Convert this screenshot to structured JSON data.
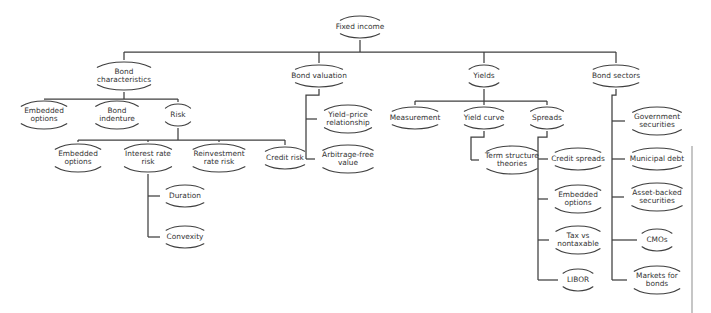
{
  "diagram": {
    "type": "tree",
    "title": "Fixed income",
    "orientation": "top-down",
    "node_shape": "split-ellipse-arcs",
    "colors": {
      "background": "#ffffff",
      "stroke": "#3f3f3f",
      "text": "#333333",
      "page_edge": "#8d8d8d"
    },
    "nodes": [
      {
        "id": "fixed-income",
        "label": "Fixed income",
        "lines": [
          "Fixed income"
        ],
        "x": 360,
        "y": 27,
        "rx": 25,
        "ry": 11,
        "level": 0
      },
      {
        "id": "bond-characteristics",
        "label": "Bond characteristics",
        "lines": [
          "Bond",
          "characteristics"
        ],
        "x": 124,
        "y": 76,
        "rx": 34,
        "ry": 14,
        "level": 1
      },
      {
        "id": "bond-valuation",
        "label": "Bond valuation",
        "lines": [
          "Bond valuation"
        ],
        "x": 319,
        "y": 76,
        "rx": 30,
        "ry": 11,
        "level": 1
      },
      {
        "id": "yields",
        "label": "Yields",
        "lines": [
          "Yields"
        ],
        "x": 484,
        "y": 76,
        "rx": 19,
        "ry": 11,
        "level": 1
      },
      {
        "id": "bond-sectors",
        "label": "Bond sectors",
        "lines": [
          "Bond sectors"
        ],
        "x": 616,
        "y": 76,
        "rx": 29,
        "ry": 11,
        "level": 1
      },
      {
        "id": "embedded-options-bc",
        "label": "Embedded options",
        "lines": [
          "Embedded",
          "options"
        ],
        "x": 44,
        "y": 115,
        "rx": 29,
        "ry": 14,
        "level": 2
      },
      {
        "id": "bond-indenture",
        "label": "Bond indenture",
        "lines": [
          "Bond",
          "indenture"
        ],
        "x": 117,
        "y": 115,
        "rx": 27,
        "ry": 14,
        "level": 2
      },
      {
        "id": "risk",
        "label": "Risk",
        "lines": [
          "Risk"
        ],
        "x": 178,
        "y": 115,
        "rx": 16,
        "ry": 11,
        "level": 2
      },
      {
        "id": "embedded-options-risk",
        "label": "Embedded options",
        "lines": [
          "Embedded",
          "options"
        ],
        "x": 78,
        "y": 158,
        "rx": 29,
        "ry": 14,
        "level": 3
      },
      {
        "id": "interest-rate-risk",
        "label": "Interest rate risk",
        "lines": [
          "Interest rate",
          "risk"
        ],
        "x": 148,
        "y": 158,
        "rx": 30,
        "ry": 14,
        "level": 3
      },
      {
        "id": "reinvestment-rate-risk",
        "label": "Reinvestment rate risk",
        "lines": [
          "Reinvestment",
          "rate risk"
        ],
        "x": 219,
        "y": 158,
        "rx": 33,
        "ry": 14,
        "level": 3
      },
      {
        "id": "credit-risk",
        "label": "Credit risk",
        "lines": [
          "Credit risk"
        ],
        "x": 285,
        "y": 158,
        "rx": 25,
        "ry": 11,
        "level": 3
      },
      {
        "id": "duration",
        "label": "Duration",
        "lines": [
          "Duration"
        ],
        "x": 185,
        "y": 196,
        "rx": 24,
        "ry": 11,
        "level": 4
      },
      {
        "id": "convexity",
        "label": "Convexity",
        "lines": [
          "Convexity"
        ],
        "x": 185,
        "y": 237,
        "rx": 24,
        "ry": 11,
        "level": 4
      },
      {
        "id": "yield-price-relationship",
        "label": "Yield–price relationship",
        "lines": [
          "Yield–price",
          "relationship"
        ],
        "x": 348,
        "y": 119,
        "rx": 30,
        "ry": 14,
        "level": 2
      },
      {
        "id": "arbitrage-free-value",
        "label": "Arbitrage-free value",
        "lines": [
          "Arbitrage-free",
          "value"
        ],
        "x": 348,
        "y": 159,
        "rx": 32,
        "ry": 14,
        "level": 2
      },
      {
        "id": "measurement",
        "label": "Measurement",
        "lines": [
          "Measurement"
        ],
        "x": 415,
        "y": 118,
        "rx": 29,
        "ry": 11,
        "level": 2
      },
      {
        "id": "yield-curve",
        "label": "Yield curve",
        "lines": [
          "Yield curve"
        ],
        "x": 484,
        "y": 118,
        "rx": 25,
        "ry": 11,
        "level": 2
      },
      {
        "id": "spreads",
        "label": "Spreads",
        "lines": [
          "Spreads"
        ],
        "x": 547,
        "y": 118,
        "rx": 21,
        "ry": 11,
        "level": 2
      },
      {
        "id": "term-structure-theories",
        "label": "Term structure theories",
        "lines": [
          "Term structure",
          "theories"
        ],
        "x": 512,
        "y": 160,
        "rx": 32,
        "ry": 14,
        "level": 3
      },
      {
        "id": "credit-spreads",
        "label": "Credit spreads",
        "lines": [
          "Credit spreads"
        ],
        "x": 578,
        "y": 159,
        "rx": 29,
        "ry": 11,
        "level": 3
      },
      {
        "id": "embedded-options-spread",
        "label": "Embedded options",
        "lines": [
          "Embedded",
          "options"
        ],
        "x": 578,
        "y": 199,
        "rx": 29,
        "ry": 14,
        "level": 3
      },
      {
        "id": "tax-vs-nontaxable",
        "label": "Tax vs nontaxable",
        "lines": [
          "Tax vs",
          "nontaxable"
        ],
        "x": 578,
        "y": 240,
        "rx": 28,
        "ry": 14,
        "level": 3
      },
      {
        "id": "libor",
        "label": "LIBOR",
        "lines": [
          "LIBOR"
        ],
        "x": 578,
        "y": 280,
        "rx": 19,
        "ry": 11,
        "level": 3
      },
      {
        "id": "government-securities",
        "label": "Government securities",
        "lines": [
          "Government",
          "securities"
        ],
        "x": 657,
        "y": 121,
        "rx": 31,
        "ry": 14,
        "level": 2
      },
      {
        "id": "municipal-debt",
        "label": "Municipal debt",
        "lines": [
          "Municipal debt"
        ],
        "x": 657,
        "y": 159,
        "rx": 31,
        "ry": 11,
        "level": 2
      },
      {
        "id": "asset-backed-securities",
        "label": "Asset-backed securities",
        "lines": [
          "Asset-backed",
          "securities"
        ],
        "x": 657,
        "y": 197,
        "rx": 32,
        "ry": 14,
        "level": 2
      },
      {
        "id": "cmos",
        "label": "CMOs",
        "lines": [
          "CMOs"
        ],
        "x": 657,
        "y": 240,
        "rx": 19,
        "ry": 11,
        "level": 2
      },
      {
        "id": "markets-for-bonds",
        "label": "Markets for bonds",
        "lines": [
          "Markets for",
          "bonds"
        ],
        "x": 657,
        "y": 280,
        "rx": 29,
        "ry": 14,
        "level": 2
      }
    ],
    "edges": [
      {
        "from": "fixed-income",
        "to": "bond-characteristics",
        "style": "bus",
        "bus_y": 52
      },
      {
        "from": "fixed-income",
        "to": "bond-valuation",
        "style": "bus",
        "bus_y": 52
      },
      {
        "from": "fixed-income",
        "to": "yields",
        "style": "bus",
        "bus_y": 52
      },
      {
        "from": "fixed-income",
        "to": "bond-sectors",
        "style": "bus",
        "bus_y": 52
      },
      {
        "from": "bond-characteristics",
        "to": "embedded-options-bc",
        "style": "bus",
        "bus_y": 99
      },
      {
        "from": "bond-characteristics",
        "to": "bond-indenture",
        "style": "bus",
        "bus_y": 99
      },
      {
        "from": "bond-characteristics",
        "to": "risk",
        "style": "bus",
        "bus_y": 99
      },
      {
        "from": "risk",
        "to": "embedded-options-risk",
        "style": "bus",
        "bus_y": 140
      },
      {
        "from": "risk",
        "to": "interest-rate-risk",
        "style": "bus",
        "bus_y": 140
      },
      {
        "from": "risk",
        "to": "reinvestment-rate-risk",
        "style": "bus",
        "bus_y": 140
      },
      {
        "from": "risk",
        "to": "credit-risk",
        "style": "bus",
        "bus_y": 140
      },
      {
        "from": "interest-rate-risk",
        "to": "duration",
        "style": "elbow",
        "spine_x": 148
      },
      {
        "from": "interest-rate-risk",
        "to": "convexity",
        "style": "elbow",
        "spine_x": 148
      },
      {
        "from": "bond-valuation",
        "to": "yield-price-relationship",
        "style": "elbow",
        "spine_x": 306
      },
      {
        "from": "bond-valuation",
        "to": "arbitrage-free-value",
        "style": "elbow",
        "spine_x": 306
      },
      {
        "from": "yields",
        "to": "measurement",
        "style": "bus",
        "bus_y": 101
      },
      {
        "from": "yields",
        "to": "yield-curve",
        "style": "bus",
        "bus_y": 101
      },
      {
        "from": "yields",
        "to": "spreads",
        "style": "bus",
        "bus_y": 101
      },
      {
        "from": "yield-curve",
        "to": "term-structure-theories",
        "style": "elbow",
        "spine_x": 471
      },
      {
        "from": "spreads",
        "to": "credit-spreads",
        "style": "elbow",
        "spine_x": 538
      },
      {
        "from": "spreads",
        "to": "embedded-options-spread",
        "style": "elbow",
        "spine_x": 538
      },
      {
        "from": "spreads",
        "to": "tax-vs-nontaxable",
        "style": "elbow",
        "spine_x": 538
      },
      {
        "from": "spreads",
        "to": "libor",
        "style": "elbow",
        "spine_x": 538
      },
      {
        "from": "bond-sectors",
        "to": "government-securities",
        "style": "elbow",
        "spine_x": 612
      },
      {
        "from": "bond-sectors",
        "to": "municipal-debt",
        "style": "elbow",
        "spine_x": 612
      },
      {
        "from": "bond-sectors",
        "to": "asset-backed-securities",
        "style": "elbow",
        "spine_x": 612
      },
      {
        "from": "bond-sectors",
        "to": "cmos",
        "style": "elbow",
        "spine_x": 612
      },
      {
        "from": "bond-sectors",
        "to": "markets-for-bonds",
        "style": "elbow",
        "spine_x": 612
      }
    ],
    "page_edge": {
      "x": 692,
      "y1": 146,
      "y2": 313
    }
  }
}
